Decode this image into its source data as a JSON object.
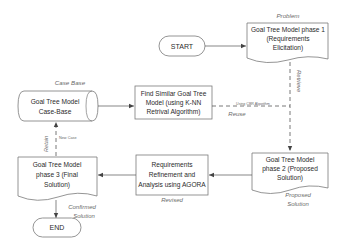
{
  "diagram": {
    "nodes": {
      "start": {
        "label": "START"
      },
      "phase1": {
        "lines": [
          "Goal Tree Model phase 1",
          "(Requirements",
          "Elicitation)"
        ],
        "caption": "Problem"
      },
      "case_base": {
        "lines": [
          "Goal Tree Model",
          "Case-Base"
        ],
        "caption": "Case Base"
      },
      "find_similar": {
        "lines": [
          "Find Similar Goal Tree",
          "Model (using K-NN",
          "Retrival Algorithm)"
        ]
      },
      "phase2": {
        "lines": [
          "Goal Tree Model",
          "phase 2 (Proposed",
          "Solution)"
        ],
        "caption_lines": [
          "Proposed",
          "Solution"
        ]
      },
      "refinement": {
        "lines": [
          "Requirements",
          "Refinement and",
          "Analysis using AGORA"
        ],
        "caption": "Revised"
      },
      "phase3": {
        "lines": [
          "Goal Tree Model",
          "phase 3 (Final",
          "Solution)"
        ],
        "caption_lines": [
          "Confirmed",
          "Solution"
        ]
      },
      "end": {
        "label": "END"
      }
    },
    "edges": {
      "retrieve": "Retrieve",
      "using_cbr": "Using CBR Algorithm",
      "reuse": "Reuse",
      "retain": "Retain",
      "new_case": "New Case"
    }
  }
}
